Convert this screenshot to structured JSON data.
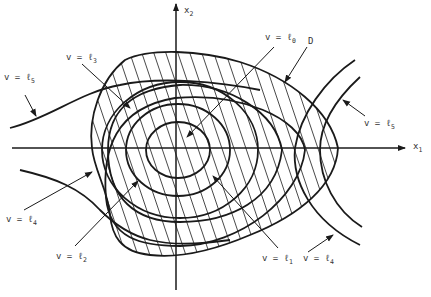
{
  "figure": {
    "type": "level-set diagram",
    "axes": {
      "x_label": "x",
      "x_sub": "1",
      "y_label": "x",
      "y_sub": "2"
    },
    "region_label": "D",
    "level_labels": [
      {
        "id": "l0",
        "text": "v = ℓ",
        "sub": "0"
      },
      {
        "id": "l1",
        "text": "v = ℓ",
        "sub": "1"
      },
      {
        "id": "l2",
        "text": "v = ℓ",
        "sub": "2"
      },
      {
        "id": "l3",
        "text": "v = ℓ",
        "sub": "3"
      },
      {
        "id": "l4_left",
        "text": "v = ℓ",
        "sub": "4"
      },
      {
        "id": "l4_right",
        "text": "v = ℓ",
        "sub": "4"
      },
      {
        "id": "l5_left",
        "text": "v = ℓ",
        "sub": "5"
      },
      {
        "id": "l5_right",
        "text": "v = ℓ",
        "sub": "5"
      }
    ],
    "colors": {
      "stroke": "#1a1a1a",
      "background": "#ffffff"
    }
  }
}
